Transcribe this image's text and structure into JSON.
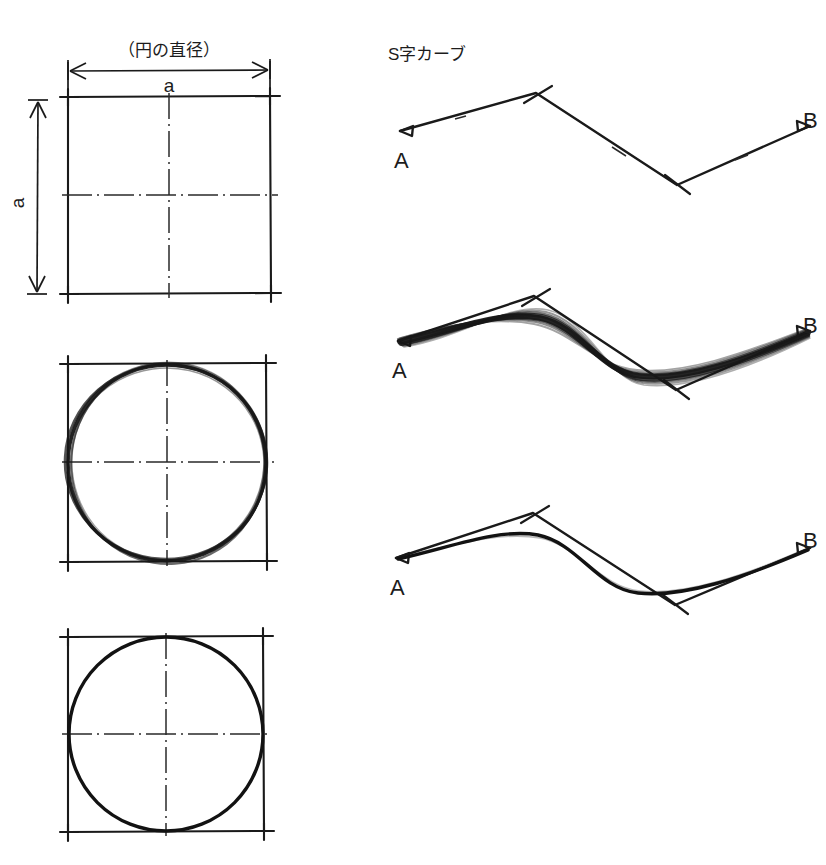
{
  "page": {
    "background_color": "#ffffff",
    "ink_color": "#141414",
    "width": 826,
    "height": 865
  },
  "left_column": {
    "caption": "（円の直径）",
    "dimension_top_label": "a",
    "dimension_left_label": "a",
    "steps": [
      {
        "name": "step-1-square-with-centerlines",
        "description": "square-guide-box",
        "square": {
          "x": 68,
          "y": 97,
          "size": 202
        },
        "has_circle": false,
        "circle_style": "none"
      },
      {
        "name": "step-2-rough-circle",
        "description": "rough-sketched-circle-in-square",
        "square": {
          "x": 68,
          "y": 364,
          "size": 198
        },
        "has_circle": true,
        "circle_style": "rough"
      },
      {
        "name": "step-3-finished-circle",
        "description": "finished-circle-in-square",
        "square": {
          "x": 68,
          "y": 637,
          "size": 195
        },
        "has_circle": true,
        "circle_style": "final"
      }
    ]
  },
  "right_column": {
    "caption": "S字カーブ",
    "start_label": "A",
    "end_label": "B",
    "steps": [
      {
        "name": "step-1-guideline-only",
        "description": "zigzag-construction-guideline",
        "curve_style": "none",
        "points": {
          "a": [
            400,
            131
          ],
          "p1": [
            536,
            93
          ],
          "p2": [
            677,
            185
          ],
          "b": [
            810,
            126
          ]
        }
      },
      {
        "name": "step-2-rough-curve",
        "description": "rough-sketched-s-curve-over-guideline",
        "curve_style": "rough",
        "points": {
          "a": [
            398,
            341
          ],
          "p1": [
            534,
            296
          ],
          "p2": [
            676,
            390
          ],
          "b": [
            810,
            331
          ]
        }
      },
      {
        "name": "step-3-finished-curve",
        "description": "finished-s-curve-over-guideline",
        "curve_style": "final",
        "points": {
          "a": [
            396,
            558
          ],
          "p1": [
            533,
            513
          ],
          "p2": [
            675,
            605
          ],
          "b": [
            810,
            548
          ]
        }
      }
    ]
  }
}
